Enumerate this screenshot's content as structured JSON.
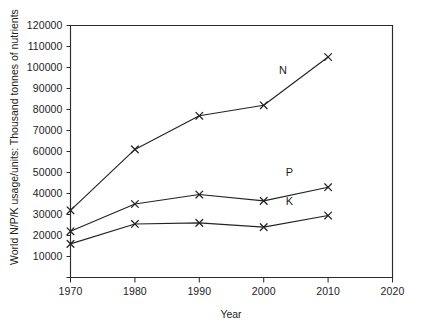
{
  "chart_data": {
    "type": "line",
    "title": "",
    "xlabel": "Year",
    "ylabel": "World N/P/K usage/units: Thousand tonnes of nutrients",
    "x": [
      1970,
      1980,
      1990,
      2000,
      2010
    ],
    "xlim": [
      1970,
      2020
    ],
    "ylim": [
      0,
      120000
    ],
    "xticks": [
      1970,
      1980,
      1990,
      2000,
      2010,
      2020
    ],
    "xtick_labels": [
      "1970",
      "1980",
      "1990",
      "2000",
      "2010",
      "2020"
    ],
    "yticks": [
      0,
      10000,
      20000,
      30000,
      40000,
      50000,
      60000,
      70000,
      80000,
      90000,
      100000,
      110000,
      120000
    ],
    "ytick_labels": [
      "",
      "10000",
      "20000",
      "30000",
      "40000",
      "50000",
      "60000",
      "70000",
      "80000",
      "90000",
      "100000",
      "110000",
      "120000"
    ],
    "grid": false,
    "legend_position": "inline-labels",
    "marker": "x",
    "series": [
      {
        "name": "N",
        "label": "N",
        "values": [
          32000,
          61000,
          77000,
          82000,
          105000
        ],
        "label_x": 2003,
        "label_y": 97000
      },
      {
        "name": "P",
        "label": "P",
        "values": [
          22000,
          35000,
          39500,
          36500,
          43000
        ],
        "label_x": 2004,
        "label_y": 48500
      },
      {
        "name": "K",
        "label": "K",
        "values": [
          16000,
          25500,
          26000,
          24000,
          29500
        ],
        "label_x": 2004,
        "label_y": 34500
      }
    ]
  }
}
